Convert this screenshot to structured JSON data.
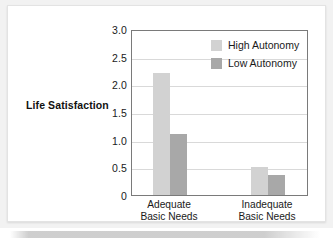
{
  "chart_data": {
    "type": "bar",
    "title": "",
    "xlabel": "",
    "ylabel": "Life Satisfaction",
    "ylim": [
      0,
      3.0
    ],
    "grid": true,
    "legend_position": "top-right",
    "categories": [
      "Adequate Basic Needs",
      "Inadequate Basic Needs"
    ],
    "category_lines": [
      [
        "Adequate",
        "Basic Needs"
      ],
      [
        "Inadequate",
        "Basic Needs"
      ]
    ],
    "ytick_labels": [
      "3.0",
      "2.5",
      "2.0",
      "1.5",
      "1.0",
      "0.5",
      "0"
    ],
    "ytick_values": [
      3.0,
      2.5,
      2.0,
      1.5,
      1.0,
      0.5,
      0
    ],
    "series": [
      {
        "name": "High Autonomy",
        "color": "#d2d2d2",
        "values": [
          2.2,
          0.5
        ]
      },
      {
        "name": "Low Autonomy",
        "color": "#a8a8a8",
        "values": [
          1.1,
          0.37
        ]
      }
    ]
  },
  "colors": {
    "high_autonomy": "#d2d2d2",
    "low_autonomy": "#a8a8a8",
    "gridline": "#d9d9d9",
    "axis": "#7a7a7a",
    "text": "#1a1a1a",
    "page_background": "#f2f2f2",
    "panel_background": "#ffffff"
  }
}
